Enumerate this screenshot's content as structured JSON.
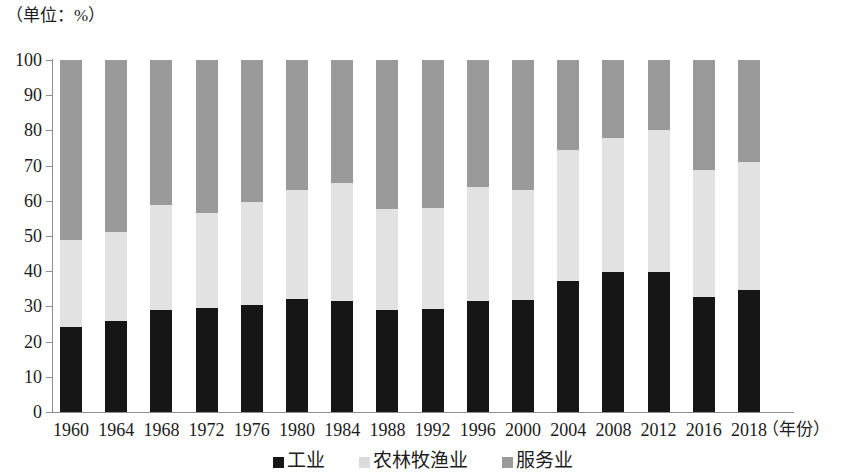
{
  "caption": {
    "unit_note": "（单位：%）",
    "xaxis_unit": "（年份）"
  },
  "legend": [
    {
      "label": "工业",
      "color": "#161616",
      "icon": "square-swatch-icon"
    },
    {
      "label": "农林牧渔业",
      "color": "#dcdcdc",
      "icon": "square-swatch-icon"
    },
    {
      "label": "服务业",
      "color": "#9a9a9a",
      "icon": "square-swatch-icon"
    }
  ],
  "yticks": [
    "0",
    "10",
    "20",
    "30",
    "40",
    "50",
    "60",
    "70",
    "80",
    "90",
    "100"
  ],
  "chart_data": {
    "type": "bar",
    "subtype": "stacked-bar-100-percent",
    "title": "",
    "subtitle": "",
    "xlabel": "（年份）",
    "ylabel": "（单位：%）",
    "ylim": [
      0,
      100
    ],
    "ytick_step": 10,
    "grid": false,
    "legend_position": "bottom-center",
    "categories": [
      "1960",
      "1964",
      "1968",
      "1972",
      "1976",
      "1980",
      "1984",
      "1988",
      "1992",
      "1996",
      "2000",
      "2004",
      "2008",
      "2012",
      "2016",
      "2018"
    ],
    "series": [
      {
        "name": "工业",
        "color": "#161616",
        "values": [
          24.1,
          25.9,
          29.0,
          29.5,
          30.4,
          32.1,
          31.5,
          28.9,
          29.3,
          31.5,
          31.8,
          37.2,
          39.8,
          39.8,
          32.7,
          34.7
        ]
      },
      {
        "name": "农林牧渔业",
        "color": "#e2e2e2",
        "values": [
          24.8,
          25.2,
          29.8,
          27.0,
          29.3,
          31.0,
          33.5,
          28.8,
          28.7,
          32.4,
          31.4,
          37.2,
          38.0,
          40.2,
          36.1,
          36.3
        ]
      },
      {
        "name": "服务业",
        "color": "#9a9a9a",
        "values": [
          51.1,
          48.9,
          41.2,
          43.5,
          40.3,
          36.9,
          35.0,
          42.3,
          42.0,
          36.1,
          36.8,
          25.6,
          22.2,
          20.0,
          31.2,
          29.0
        ]
      }
    ],
    "cumulative_tops": {
      "industry": [
        24.1,
        25.9,
        29.0,
        29.5,
        30.4,
        32.1,
        31.5,
        28.9,
        29.3,
        31.5,
        31.8,
        37.2,
        39.8,
        39.8,
        32.7,
        34.7
      ],
      "industry_plus_agriculture": [
        48.9,
        51.1,
        58.8,
        56.5,
        59.7,
        63.1,
        65.0,
        57.7,
        58.0,
        63.9,
        63.2,
        74.4,
        77.8,
        80.0,
        68.8,
        71.0
      ],
      "total": [
        100,
        100,
        100,
        100,
        100,
        100,
        100,
        100,
        100,
        100,
        100,
        100,
        100,
        100,
        100,
        100
      ]
    }
  }
}
